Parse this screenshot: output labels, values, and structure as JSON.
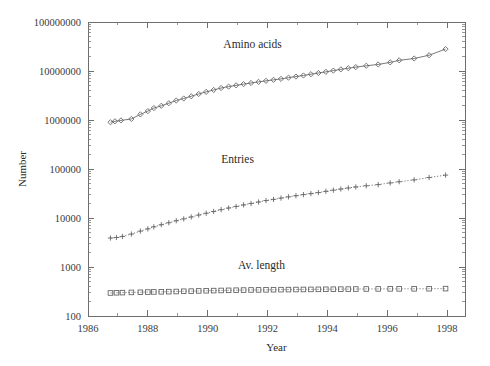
{
  "chart_data": {
    "type": "line",
    "title": "",
    "xlabel": "Year",
    "ylabel": "Number",
    "yscale": "log",
    "xlim": [
      1986.0,
      1998.6
    ],
    "ylim": [
      100,
      100000000
    ],
    "grid": false,
    "legend_position": "inline-annotations",
    "x_ticks_major": [
      1986,
      1988,
      1990,
      1992,
      1994,
      1996,
      1998
    ],
    "x_tick_labels": [
      "1986",
      "1988",
      "1990",
      "1992",
      "1994",
      "1996",
      "1998"
    ],
    "x_ticks_minor": [
      1987,
      1989,
      1991,
      1993,
      1995,
      1997
    ],
    "y_ticks_major": [
      100,
      1000,
      10000,
      100000,
      1000000,
      10000000,
      100000000
    ],
    "y_tick_labels": [
      "100",
      "1000",
      "10000",
      "100000",
      "1000000",
      "10000000",
      "100000000"
    ],
    "series": [
      {
        "name": "Amino acids",
        "marker": "diamond",
        "line": "solid",
        "label_x": 1991.5,
        "label_y": 30000000,
        "points": [
          [
            1986.75,
            900000
          ],
          [
            1986.9,
            940000
          ],
          [
            1987.1,
            980000
          ],
          [
            1987.45,
            1050000
          ],
          [
            1987.75,
            1300000
          ],
          [
            1988.0,
            1520000
          ],
          [
            1988.2,
            1750000
          ],
          [
            1988.45,
            1950000
          ],
          [
            1988.7,
            2200000
          ],
          [
            1988.95,
            2500000
          ],
          [
            1989.2,
            2750000
          ],
          [
            1989.45,
            3050000
          ],
          [
            1989.7,
            3400000
          ],
          [
            1989.95,
            3750000
          ],
          [
            1990.2,
            4100000
          ],
          [
            1990.45,
            4500000
          ],
          [
            1990.7,
            4800000
          ],
          [
            1990.95,
            5100000
          ],
          [
            1991.2,
            5400000
          ],
          [
            1991.45,
            5700000
          ],
          [
            1991.7,
            6000000
          ],
          [
            1991.95,
            6300000
          ],
          [
            1992.2,
            6600000
          ],
          [
            1992.45,
            6900000
          ],
          [
            1992.7,
            7300000
          ],
          [
            1992.95,
            7700000
          ],
          [
            1993.2,
            8100000
          ],
          [
            1993.45,
            8600000
          ],
          [
            1993.7,
            9100000
          ],
          [
            1993.95,
            9600000
          ],
          [
            1994.2,
            10200000
          ],
          [
            1994.45,
            10800000
          ],
          [
            1994.7,
            11400000
          ],
          [
            1994.95,
            12000000
          ],
          [
            1995.3,
            12800000
          ],
          [
            1995.7,
            13600000
          ],
          [
            1996.1,
            15000000
          ],
          [
            1996.4,
            16500000
          ],
          [
            1996.9,
            18000000
          ],
          [
            1997.4,
            21000000
          ],
          [
            1997.95,
            28000000
          ]
        ]
      },
      {
        "name": "Entries",
        "marker": "plus",
        "line": "dotted",
        "label_x": 1991.0,
        "label_y": 130000,
        "points": [
          [
            1986.75,
            3900
          ],
          [
            1986.95,
            4000
          ],
          [
            1987.15,
            4200
          ],
          [
            1987.45,
            4700
          ],
          [
            1987.75,
            5400
          ],
          [
            1988.0,
            6000
          ],
          [
            1988.2,
            6600
          ],
          [
            1988.45,
            7300
          ],
          [
            1988.7,
            8000
          ],
          [
            1988.95,
            8800
          ],
          [
            1989.2,
            9600
          ],
          [
            1989.45,
            10500
          ],
          [
            1989.7,
            11500
          ],
          [
            1989.95,
            12500
          ],
          [
            1990.2,
            13600
          ],
          [
            1990.45,
            14800
          ],
          [
            1990.7,
            16000
          ],
          [
            1990.95,
            17200
          ],
          [
            1991.2,
            18500
          ],
          [
            1991.45,
            19800
          ],
          [
            1991.7,
            21200
          ],
          [
            1991.95,
            22700
          ],
          [
            1992.2,
            24000
          ],
          [
            1992.45,
            25500
          ],
          [
            1992.7,
            27000
          ],
          [
            1992.95,
            28500
          ],
          [
            1993.2,
            30000
          ],
          [
            1993.45,
            31500
          ],
          [
            1993.7,
            33000
          ],
          [
            1993.95,
            35000
          ],
          [
            1994.2,
            37000
          ],
          [
            1994.45,
            39000
          ],
          [
            1994.7,
            41000
          ],
          [
            1994.95,
            43000
          ],
          [
            1995.3,
            45500
          ],
          [
            1995.7,
            48000
          ],
          [
            1996.1,
            52000
          ],
          [
            1996.4,
            55000
          ],
          [
            1996.9,
            60000
          ],
          [
            1997.4,
            67000
          ],
          [
            1997.95,
            75000
          ]
        ]
      },
      {
        "name": "Av. length",
        "marker": "square",
        "line": "dotted",
        "label_x": 1991.8,
        "label_y": 900,
        "points": [
          [
            1986.75,
            295
          ],
          [
            1986.95,
            298
          ],
          [
            1987.15,
            300
          ],
          [
            1987.45,
            303
          ],
          [
            1987.75,
            305
          ],
          [
            1988.0,
            308
          ],
          [
            1988.2,
            310
          ],
          [
            1988.45,
            312
          ],
          [
            1988.7,
            314
          ],
          [
            1988.95,
            316
          ],
          [
            1989.2,
            320
          ],
          [
            1989.45,
            322
          ],
          [
            1989.7,
            325
          ],
          [
            1989.95,
            328
          ],
          [
            1990.2,
            330
          ],
          [
            1990.45,
            332
          ],
          [
            1990.7,
            334
          ],
          [
            1990.95,
            336
          ],
          [
            1991.2,
            338
          ],
          [
            1991.45,
            340
          ],
          [
            1991.7,
            341
          ],
          [
            1991.95,
            342
          ],
          [
            1992.2,
            344
          ],
          [
            1992.45,
            345
          ],
          [
            1992.7,
            346
          ],
          [
            1992.95,
            347
          ],
          [
            1993.2,
            348
          ],
          [
            1993.45,
            349
          ],
          [
            1993.7,
            350
          ],
          [
            1993.95,
            351
          ],
          [
            1994.2,
            352
          ],
          [
            1994.45,
            353
          ],
          [
            1994.7,
            354
          ],
          [
            1994.95,
            355
          ],
          [
            1995.3,
            356
          ],
          [
            1995.7,
            357
          ],
          [
            1996.1,
            358
          ],
          [
            1996.4,
            358
          ],
          [
            1996.9,
            359
          ],
          [
            1997.4,
            360
          ],
          [
            1997.95,
            362
          ]
        ]
      }
    ]
  },
  "axes": {
    "x_title": "Year",
    "y_title": "Number"
  }
}
